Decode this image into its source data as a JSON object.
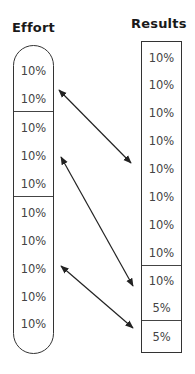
{
  "effort": {
    "title": "Effort",
    "groups": [
      {
        "cells": [
          "10%",
          "10%"
        ]
      },
      {
        "cells": [
          "10%",
          "10%",
          "10%"
        ]
      },
      {
        "cells": [
          "10%",
          "10%",
          "10%",
          "10%",
          "10%"
        ]
      }
    ],
    "cells": [
      "10%",
      "10%",
      "10%",
      "10%",
      "10%",
      "10%",
      "10%",
      "10%",
      "10%",
      "10%"
    ]
  },
  "results": {
    "title": "Results",
    "groups": [
      {
        "cells": [
          "10%",
          "10%",
          "10%",
          "10%",
          "10%",
          "10%",
          "10%",
          "10%"
        ]
      },
      {
        "cells": [
          "10%",
          "5%"
        ]
      },
      {
        "cells": [
          "5%"
        ]
      }
    ],
    "cells": [
      "10%",
      "10%",
      "10%",
      "10%",
      "10%",
      "10%",
      "10%",
      "10%",
      "10%",
      "5%",
      "5%"
    ]
  },
  "arrows": [
    {
      "from": "effort-group-1",
      "to": "results-group-1",
      "type": "double-headed"
    },
    {
      "from": "effort-group-2",
      "to": "results-group-2",
      "type": "double-headed"
    },
    {
      "from": "effort-group-3",
      "to": "results-group-3",
      "type": "double-headed"
    }
  ],
  "colors": {
    "stroke": "#333333",
    "text": "#444444",
    "title": "#1a1a1a"
  }
}
